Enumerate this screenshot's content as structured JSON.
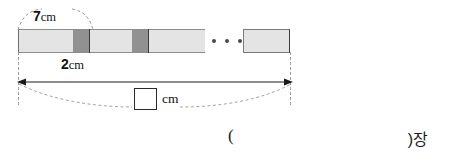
{
  "figure": {
    "type": "segmented-strip-diagram",
    "strip": {
      "light_color": "#e4e4e4",
      "dark_color": "#919191",
      "outline_color": "#3a3a3a",
      "segments": [
        {
          "kind": "light",
          "left": 0,
          "width": 55
        },
        {
          "kind": "dark",
          "left": 55,
          "width": 16
        },
        {
          "kind": "light",
          "left": 72,
          "width": 42
        },
        {
          "kind": "dark",
          "left": 114,
          "width": 16
        },
        {
          "kind": "light",
          "left": 131,
          "width": 56
        }
      ],
      "dividers": [
        71,
        130
      ],
      "tail": {
        "left": 225,
        "width": 47
      }
    },
    "ellipsis": {
      "dots": 3,
      "label": "continues-pattern"
    }
  },
  "labels": {
    "overlap_top": {
      "number": "7",
      "unit": "cm"
    },
    "overlap_bottom": {
      "number": "2",
      "unit": "cm"
    }
  },
  "total": {
    "answer_placeholder": "",
    "unit": "cm"
  },
  "answer_line": {
    "paren_open": "(",
    "paren_close": ")장"
  },
  "icons": {
    "ellipsis": "horizontal-ellipsis-icon",
    "arrow_left": "arrow-left-head-icon",
    "arrow_right": "arrow-right-head-icon"
  }
}
